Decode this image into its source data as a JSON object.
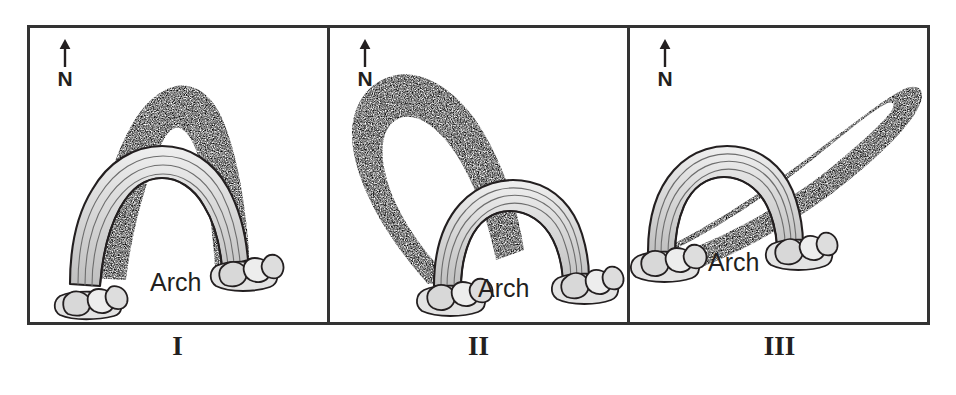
{
  "figure": {
    "type": "diagram",
    "panel_count": 3,
    "frame_color": "#333333",
    "background_color": "#ffffff",
    "shadow_color": "#8c8c8c",
    "line_color": "#231f20"
  },
  "panels": [
    {
      "id": "panel-1",
      "caption": "I",
      "compass": {
        "letter": "N",
        "direction": "up",
        "icon": "north-arrow-icon"
      },
      "arch_label": "Arch",
      "shadow": {
        "description": "Shadow cast directly to the north (up), tall and narrow",
        "direction": "north",
        "bearing_degrees": 0,
        "relative_length": "long"
      }
    },
    {
      "id": "panel-2",
      "caption": "II",
      "compass": {
        "letter": "N",
        "direction": "up",
        "icon": "north-arrow-icon"
      },
      "arch_label": "Arch",
      "shadow": {
        "description": "Shadow cast to the northwest (upper left), long and broad",
        "direction": "northwest",
        "bearing_degrees": 315,
        "relative_length": "longest"
      }
    },
    {
      "id": "panel-3",
      "caption": "III",
      "compass": {
        "letter": "N",
        "direction": "up",
        "icon": "north-arrow-icon"
      },
      "arch_label": "Arch",
      "shadow": {
        "description": "Shadow cast to the northeast (upper right), long and narrow",
        "direction": "northeast",
        "bearing_degrees": 45,
        "relative_length": "long"
      }
    }
  ]
}
